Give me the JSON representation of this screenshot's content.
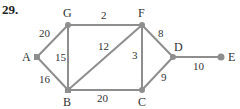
{
  "problem": {
    "number": "29."
  },
  "graph": {
    "nodes": [
      {
        "id": "A",
        "label": "A",
        "x": 37,
        "y": 57
      },
      {
        "id": "G",
        "label": "G",
        "x": 68,
        "y": 25
      },
      {
        "id": "F",
        "label": "F",
        "x": 142,
        "y": 25
      },
      {
        "id": "B",
        "label": "B",
        "x": 68,
        "y": 90
      },
      {
        "id": "C",
        "label": "C",
        "x": 142,
        "y": 90
      },
      {
        "id": "D",
        "label": "D",
        "x": 173,
        "y": 57
      },
      {
        "id": "E",
        "label": "E",
        "x": 221,
        "y": 57
      }
    ],
    "edges": [
      {
        "from": "A",
        "to": "G",
        "weight": "20"
      },
      {
        "from": "A",
        "to": "B",
        "weight": "16"
      },
      {
        "from": "G",
        "to": "B",
        "weight": "15"
      },
      {
        "from": "G",
        "to": "F",
        "weight": "2"
      },
      {
        "from": "F",
        "to": "B",
        "weight": "12"
      },
      {
        "from": "F",
        "to": "C",
        "weight": "3"
      },
      {
        "from": "F",
        "to": "D",
        "weight": "8"
      },
      {
        "from": "B",
        "to": "C",
        "weight": "20"
      },
      {
        "from": "C",
        "to": "D",
        "weight": "9"
      },
      {
        "from": "D",
        "to": "E",
        "weight": "10"
      }
    ],
    "colors": {
      "edge": "#8e8e8e",
      "node": "#8e8e8e",
      "text": "#333333"
    }
  }
}
